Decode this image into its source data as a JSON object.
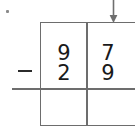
{
  "worksheet": {
    "type": "vertical-subtraction",
    "operator": "−",
    "columns": [
      "tens",
      "ones"
    ],
    "minuend": {
      "tens": "9",
      "ones": "7",
      "value": "97"
    },
    "subtrahend": {
      "tens": "2",
      "ones": "9",
      "value": "29"
    },
    "answer": {
      "tens": "",
      "ones": ""
    },
    "pointer": {
      "icon": "arrow-down-icon",
      "points_to_column": "ones"
    },
    "marks": {
      "speck": ""
    },
    "colors": {
      "ink": "#1a1a1a",
      "rule": "#6d6d6d",
      "paper": "#ffffff"
    }
  }
}
